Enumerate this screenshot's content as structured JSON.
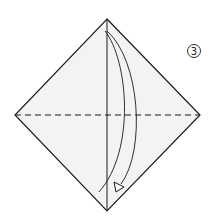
{
  "diagram": {
    "type": "origami-step",
    "step_number": "3",
    "paper_fill": "#f3f3f3",
    "line_color": "#1a1a1a",
    "elements": {
      "paper": "square-diamond",
      "fold_line": "horizontal valley fold (dashed)",
      "crease": "vertical center crease",
      "arrow": "fold top corner down to bottom corner"
    }
  }
}
